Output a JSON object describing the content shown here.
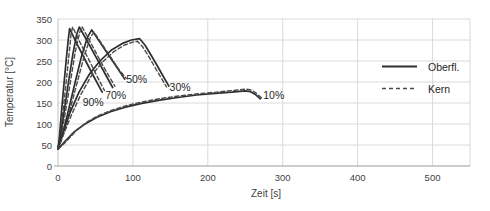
{
  "chart_data": {
    "type": "line",
    "title": "",
    "xlabel": "Zeit [s]",
    "ylabel": "Temperatur [°C]",
    "xlim": [
      0,
      550
    ],
    "ylim": [
      0,
      350
    ],
    "xticks": [
      0,
      100,
      200,
      300,
      400,
      500
    ],
    "yticks": [
      0,
      50,
      100,
      150,
      200,
      250,
      300,
      350
    ],
    "grid": true,
    "legend_position": "right-center",
    "legend": [
      {
        "label": "Oberfl.",
        "style": "solid"
      },
      {
        "label": "Kern",
        "style": "dashed"
      }
    ],
    "annotations": [
      {
        "text": "90%",
        "x": 47,
        "y": 152
      },
      {
        "text": "70%",
        "x": 77,
        "y": 167
      },
      {
        "text": "50%",
        "x": 105,
        "y": 205
      },
      {
        "text": "30%",
        "x": 163,
        "y": 188
      },
      {
        "text": "10%",
        "x": 288,
        "y": 168
      }
    ],
    "series": [
      {
        "name": "90% Oberfl.",
        "percent": "90%",
        "style": "solid",
        "points": [
          [
            0,
            40
          ],
          [
            2,
            72
          ],
          [
            5,
            135
          ],
          [
            8,
            196
          ],
          [
            11,
            252
          ],
          [
            13.5,
            298
          ],
          [
            15.5,
            327
          ],
          [
            25,
            292
          ],
          [
            37,
            250
          ],
          [
            48,
            212
          ],
          [
            59,
            176
          ]
        ]
      },
      {
        "name": "90% Kern",
        "percent": "90%",
        "style": "dashed",
        "points": [
          [
            0,
            40
          ],
          [
            3,
            70
          ],
          [
            7,
            135
          ],
          [
            11,
            200
          ],
          [
            15,
            270
          ],
          [
            17.5,
            315
          ],
          [
            19.5,
            331
          ],
          [
            30,
            292
          ],
          [
            42,
            250
          ],
          [
            52,
            214
          ],
          [
            62,
            180
          ]
        ]
      },
      {
        "name": "70% Oberfl.",
        "percent": "70%",
        "style": "solid",
        "points": [
          [
            0,
            40
          ],
          [
            4,
            80
          ],
          [
            9,
            138
          ],
          [
            14,
            200
          ],
          [
            20,
            268
          ],
          [
            25,
            313
          ],
          [
            28.5,
            331
          ],
          [
            40,
            294
          ],
          [
            52,
            255
          ],
          [
            63,
            219
          ],
          [
            73,
            187
          ]
        ]
      },
      {
        "name": "70% Kern",
        "percent": "70%",
        "style": "dashed",
        "points": [
          [
            0,
            40
          ],
          [
            5,
            78
          ],
          [
            11,
            140
          ],
          [
            17,
            205
          ],
          [
            23,
            272
          ],
          [
            29,
            318
          ],
          [
            32,
            332
          ],
          [
            44,
            292
          ],
          [
            56,
            252
          ],
          [
            67,
            217
          ],
          [
            76,
            190
          ]
        ]
      },
      {
        "name": "50% Oberfl.",
        "percent": "50%",
        "style": "solid",
        "points": [
          [
            0,
            40
          ],
          [
            7,
            82
          ],
          [
            15,
            140
          ],
          [
            23,
            200
          ],
          [
            31,
            258
          ],
          [
            39,
            305
          ],
          [
            45,
            324
          ],
          [
            57,
            292
          ],
          [
            69,
            260
          ],
          [
            79,
            234
          ],
          [
            89,
            207
          ]
        ]
      },
      {
        "name": "50% Kern",
        "percent": "50%",
        "style": "dashed",
        "points": [
          [
            0,
            40
          ],
          [
            8,
            80
          ],
          [
            17,
            140
          ],
          [
            26,
            202
          ],
          [
            35,
            262
          ],
          [
            43,
            305
          ],
          [
            48,
            319
          ],
          [
            60,
            287
          ],
          [
            72,
            255
          ],
          [
            82,
            228
          ],
          [
            91,
            209
          ]
        ]
      },
      {
        "name": "30% Oberfl.",
        "percent": "30%",
        "style": "solid",
        "points": [
          [
            0,
            40
          ],
          [
            8,
            86
          ],
          [
            16,
            127
          ],
          [
            28,
            176
          ],
          [
            42,
            219
          ],
          [
            56,
            250
          ],
          [
            72,
            277
          ],
          [
            86,
            292
          ],
          [
            98,
            300
          ],
          [
            109,
            303
          ],
          [
            116,
            288
          ],
          [
            125,
            262
          ],
          [
            134,
            234
          ],
          [
            141,
            212
          ],
          [
            148,
            190
          ]
        ]
      },
      {
        "name": "30% Kern",
        "percent": "30%",
        "style": "dashed",
        "points": [
          [
            0,
            40
          ],
          [
            9,
            82
          ],
          [
            18,
            122
          ],
          [
            31,
            172
          ],
          [
            45,
            216
          ],
          [
            59,
            247
          ],
          [
            75,
            273
          ],
          [
            89,
            288
          ],
          [
            100,
            295
          ],
          [
            106,
            297
          ],
          [
            113,
            284
          ],
          [
            122,
            258
          ],
          [
            131,
            230
          ],
          [
            138,
            209
          ],
          [
            145,
            188
          ]
        ]
      },
      {
        "name": "10% Oberfl.",
        "percent": "10%",
        "style": "solid",
        "points": [
          [
            0,
            40
          ],
          [
            10,
            60
          ],
          [
            22,
            82
          ],
          [
            36,
            100
          ],
          [
            52,
            116
          ],
          [
            70,
            129
          ],
          [
            90,
            140
          ],
          [
            112,
            149
          ],
          [
            136,
            157
          ],
          [
            160,
            163
          ],
          [
            185,
            169
          ],
          [
            210,
            173
          ],
          [
            232,
            176
          ],
          [
            250,
            179
          ],
          [
            257,
            177
          ],
          [
            263,
            171
          ],
          [
            270,
            160
          ]
        ]
      },
      {
        "name": "10% Kern",
        "percent": "10%",
        "style": "dashed",
        "points": [
          [
            0,
            40
          ],
          [
            11,
            58
          ],
          [
            24,
            84
          ],
          [
            38,
            104
          ],
          [
            54,
            120
          ],
          [
            72,
            133
          ],
          [
            92,
            144
          ],
          [
            114,
            153
          ],
          [
            138,
            161
          ],
          [
            162,
            167
          ],
          [
            187,
            172
          ],
          [
            212,
            176
          ],
          [
            234,
            180
          ],
          [
            251,
            183
          ],
          [
            258,
            181
          ],
          [
            264,
            174
          ],
          [
            272,
            162
          ]
        ]
      }
    ],
    "colors": {
      "solid_line": "#2e2e2e",
      "dashed_line": "#4a4a4a",
      "grid": "#dadada",
      "axis": "#9b9b9b",
      "axis_left": "#c0c0c0",
      "text": "#3f3f3f"
    }
  }
}
